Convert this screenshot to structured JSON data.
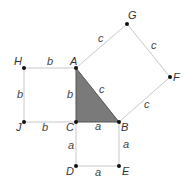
{
  "diagram": {
    "title": "",
    "colors": {
      "line": "#c8c8c8",
      "triangle": "#7a7a7a",
      "point": "#111111",
      "text": "#444444"
    },
    "points": {
      "A": {
        "label": "A",
        "x": 76,
        "y": 68
      },
      "B": {
        "label": "B",
        "x": 119,
        "y": 122
      },
      "C": {
        "label": "C",
        "x": 76,
        "y": 122
      },
      "D": {
        "label": "D",
        "x": 76,
        "y": 166
      },
      "E": {
        "label": "E",
        "x": 119,
        "y": 166
      },
      "F": {
        "label": "F",
        "x": 170,
        "y": 77
      },
      "G": {
        "label": "G",
        "x": 127,
        "y": 24
      },
      "H": {
        "label": "H",
        "x": 24,
        "y": 68
      },
      "J": {
        "label": "J",
        "x": 24,
        "y": 122
      }
    },
    "side_labels": {
      "HA": "b",
      "HJ": "b",
      "AC": "b",
      "JC": "b",
      "CB": "a",
      "CD": "a",
      "BE": "a",
      "DE": "a",
      "AG": "c",
      "GF": "c",
      "FB": "c",
      "AB": "c"
    }
  }
}
